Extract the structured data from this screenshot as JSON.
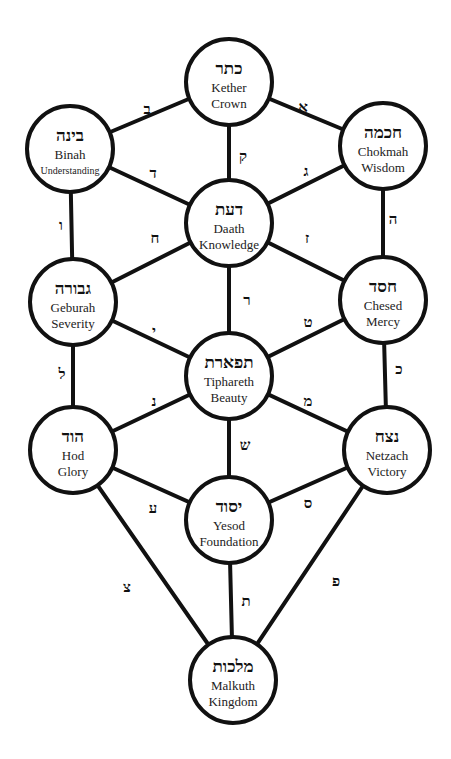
{
  "diagram": {
    "colors": {
      "stroke": "#111111",
      "fill": "#ffffff",
      "text": "#111111"
    },
    "node_radius": 43,
    "nodes": [
      {
        "id": "kether",
        "hebrew": "כתר",
        "name": "Kether",
        "meaning": "Crown",
        "x": 229,
        "y": 82
      },
      {
        "id": "binah",
        "hebrew": "בינה",
        "name": "Binah",
        "meaning": "Understanding",
        "x": 70,
        "y": 149
      },
      {
        "id": "chokmah",
        "hebrew": "חכמה",
        "name": "Chokmah",
        "meaning": "Wisdom",
        "x": 383,
        "y": 146
      },
      {
        "id": "daath",
        "hebrew": "דעת",
        "name": "Daath",
        "meaning": "Knowledge",
        "x": 229,
        "y": 223
      },
      {
        "id": "geburah",
        "hebrew": "גבורה",
        "name": "Geburah",
        "meaning": "Severity",
        "x": 73,
        "y": 302
      },
      {
        "id": "chesed",
        "hebrew": "חסד",
        "name": "Chesed",
        "meaning": "Mercy",
        "x": 383,
        "y": 300
      },
      {
        "id": "tiphareth",
        "hebrew": "תפארת",
        "name": "Tiphareth",
        "meaning": "Beauty",
        "x": 229,
        "y": 376
      },
      {
        "id": "hod",
        "hebrew": "הוד",
        "name": "Hod",
        "meaning": "Glory",
        "x": 73,
        "y": 450
      },
      {
        "id": "netzach",
        "hebrew": "נצח",
        "name": "Netzach",
        "meaning": "Victory",
        "x": 387,
        "y": 450
      },
      {
        "id": "yesod",
        "hebrew": "יסוד",
        "name": "Yesod",
        "meaning": "Foundation",
        "x": 229,
        "y": 520
      },
      {
        "id": "malkuth",
        "hebrew": "מלכות",
        "name": "Malkuth",
        "meaning": "Kingdom",
        "x": 233,
        "y": 680
      }
    ],
    "paths": [
      {
        "from": "kether",
        "to": "binah",
        "letter": "ב",
        "lx": 147,
        "ly": 109
      },
      {
        "from": "kether",
        "to": "chokmah",
        "letter": "א",
        "lx": 303,
        "ly": 107
      },
      {
        "from": "kether",
        "to": "daath",
        "letter": "ק",
        "lx": 243,
        "ly": 156
      },
      {
        "from": "binah",
        "to": "daath",
        "letter": "ד",
        "lx": 153,
        "ly": 173
      },
      {
        "from": "chokmah",
        "to": "daath",
        "letter": "ג",
        "lx": 306,
        "ly": 171
      },
      {
        "from": "binah",
        "to": "geburah",
        "letter": "ו",
        "lx": 61,
        "ly": 225
      },
      {
        "from": "daath",
        "to": "geburah",
        "letter": "ח",
        "lx": 155,
        "ly": 238
      },
      {
        "from": "daath",
        "to": "chesed",
        "letter": "ז",
        "lx": 307,
        "ly": 238
      },
      {
        "from": "chokmah",
        "to": "chesed",
        "letter": "ה",
        "lx": 393,
        "ly": 219
      },
      {
        "from": "daath",
        "to": "tiphareth",
        "letter": "ר",
        "lx": 247,
        "ly": 300
      },
      {
        "from": "geburah",
        "to": "tiphareth",
        "letter": "י",
        "lx": 154,
        "ly": 331
      },
      {
        "from": "chesed",
        "to": "tiphareth",
        "letter": "ט",
        "lx": 308,
        "ly": 322
      },
      {
        "from": "geburah",
        "to": "hod",
        "letter": "ל",
        "lx": 62,
        "ly": 374
      },
      {
        "from": "chesed",
        "to": "netzach",
        "letter": "כ",
        "lx": 399,
        "ly": 369
      },
      {
        "from": "tiphareth",
        "to": "hod",
        "letter": "נ",
        "lx": 154,
        "ly": 401
      },
      {
        "from": "tiphareth",
        "to": "netzach",
        "letter": "מ",
        "lx": 308,
        "ly": 401
      },
      {
        "from": "tiphareth",
        "to": "yesod",
        "letter": "ש",
        "lx": 245,
        "ly": 445
      },
      {
        "from": "hod",
        "to": "yesod",
        "letter": "ע",
        "lx": 153,
        "ly": 508
      },
      {
        "from": "netzach",
        "to": "yesod",
        "letter": "ס",
        "lx": 308,
        "ly": 503
      },
      {
        "from": "hod",
        "to": "malkuth",
        "letter": "צ",
        "lx": 127,
        "ly": 587
      },
      {
        "from": "yesod",
        "to": "malkuth",
        "letter": "ת",
        "lx": 246,
        "ly": 601
      },
      {
        "from": "netzach",
        "to": "malkuth",
        "letter": "פ",
        "lx": 336,
        "ly": 581
      }
    ]
  }
}
